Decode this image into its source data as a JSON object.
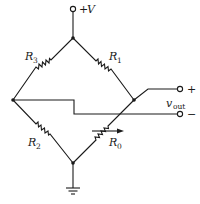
{
  "diagram": {
    "type": "wheatstone-bridge-circuit",
    "supply_label": "+V",
    "supply_symbol": "V",
    "supply_sign": "+",
    "resistors": [
      {
        "id": "R3",
        "letter": "R",
        "subscript": "3",
        "position": "upper-left",
        "variable": false
      },
      {
        "id": "R1",
        "letter": "R",
        "subscript": "1",
        "position": "upper-right",
        "variable": false
      },
      {
        "id": "R2",
        "letter": "R",
        "subscript": "2",
        "position": "lower-left",
        "variable": false
      },
      {
        "id": "R0",
        "letter": "R",
        "subscript": "0",
        "position": "lower-right",
        "variable": true
      }
    ],
    "output": {
      "letter": "v",
      "subscript": "out",
      "plus_sign": "+",
      "minus_sign": "−"
    },
    "ground": "ground-symbol",
    "colors": {
      "ink": "#1a1a1a",
      "background": "#ffffff"
    }
  }
}
